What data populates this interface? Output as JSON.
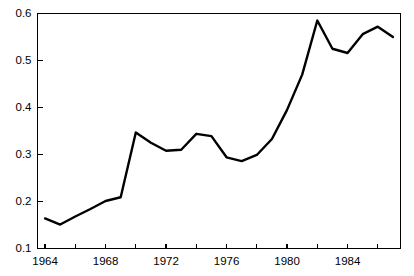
{
  "chart_data": {
    "type": "line",
    "title": "",
    "subtitle": "",
    "xlabel": "",
    "ylabel": "",
    "xlim": [
      1963.5,
      1987.5
    ],
    "ylim": [
      0.1,
      0.6
    ],
    "grid": false,
    "legend": null,
    "x": [
      1964,
      1965,
      1966,
      1967,
      1968,
      1969,
      1970,
      1971,
      1972,
      1973,
      1974,
      1975,
      1976,
      1977,
      1978,
      1979,
      1980,
      1981,
      1982,
      1983,
      1984,
      1985,
      1986,
      1987
    ],
    "values": [
      0.164,
      0.151,
      0.168,
      0.184,
      0.201,
      0.209,
      0.347,
      0.325,
      0.308,
      0.31,
      0.344,
      0.339,
      0.294,
      0.286,
      0.299,
      0.333,
      0.395,
      0.47,
      0.585,
      0.525,
      0.516,
      0.556,
      0.572,
      0.55
    ],
    "series": [
      {
        "name": "series-1",
        "values": [
          0.164,
          0.151,
          0.168,
          0.184,
          0.201,
          0.209,
          0.347,
          0.325,
          0.308,
          0.31,
          0.344,
          0.339,
          0.294,
          0.286,
          0.299,
          0.333,
          0.395,
          0.47,
          0.585,
          0.525,
          0.516,
          0.556,
          0.572,
          0.55
        ],
        "color": "#000000"
      }
    ],
    "y_ticks": [
      0.1,
      0.2,
      0.3,
      0.4,
      0.5,
      0.6
    ],
    "y_tick_labels": [
      "0.1",
      "0.2",
      "0.3",
      "0.4",
      "0.5",
      "0.6"
    ],
    "x_ticks": [
      1964,
      1966,
      1968,
      1970,
      1972,
      1974,
      1976,
      1978,
      1980,
      1982,
      1984,
      1986
    ],
    "x_tick_labels": [
      "1964",
      "",
      "1968",
      "",
      "1972",
      "",
      "1976",
      "",
      "1980",
      "",
      "1984",
      ""
    ],
    "x_labeled_ticks": [
      1964,
      1968,
      1972,
      1976,
      1980,
      1984
    ],
    "x_labeled_text": [
      "1964",
      "1968",
      "1972",
      "1976",
      "1980",
      "1984"
    ],
    "axis_color": "#000000",
    "line_color": "#000000",
    "background_color": "#ffffff"
  }
}
